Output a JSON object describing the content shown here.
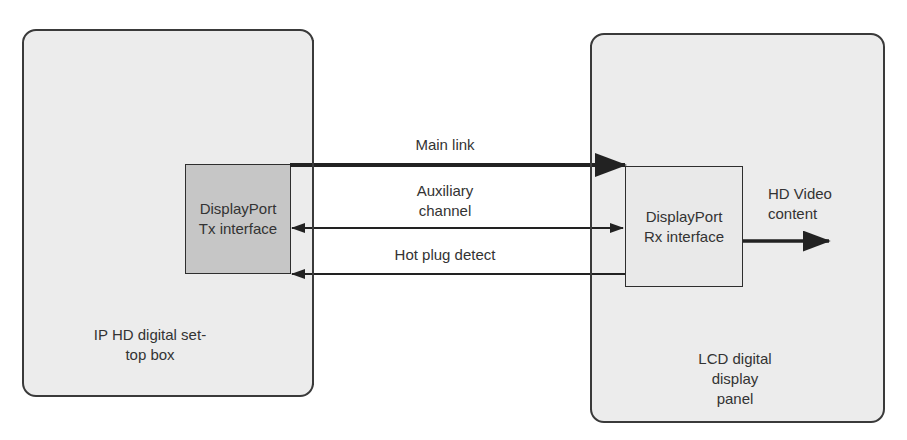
{
  "diagram": {
    "title": "",
    "devices": [
      {
        "id": "stb",
        "label_line1": "IP HD digital set-",
        "label_line2": "top box"
      },
      {
        "id": "lcd",
        "label_line1": "LCD digital",
        "label_line2": "display",
        "label_line3": "panel"
      }
    ],
    "interfaces": {
      "tx": {
        "line1": "DisplayPort",
        "line2": "Tx interface"
      },
      "rx": {
        "line1": "DisplayPort",
        "line2": "Rx interface"
      }
    },
    "links": [
      {
        "id": "main-link",
        "label": "Main link",
        "direction": "tx-to-rx",
        "weight": "thick"
      },
      {
        "id": "aux-channel",
        "label_line1": "Auxiliary",
        "label_line2": "channel",
        "direction": "bidirectional",
        "weight": "thin"
      },
      {
        "id": "hot-plug-detect",
        "label": "Hot plug detect",
        "direction": "rx-to-tx",
        "weight": "thin"
      }
    ],
    "output": {
      "label_line1": "HD Video",
      "label_line2": "content",
      "direction": "out"
    },
    "colors": {
      "device_fill": "#ececec",
      "tx_fill": "#c6c6c6",
      "rx_fill": "#e9e9e9",
      "line": "#2a2a2a",
      "channel_bg": "#ffffff"
    }
  }
}
